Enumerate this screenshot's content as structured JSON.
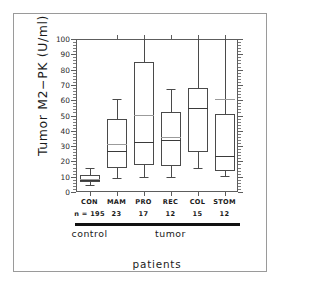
{
  "chart_data": {
    "type": "box",
    "title": "",
    "ylabel": "Tumor M2−PK (U/ml)",
    "xlabel": "patients",
    "ylim": [
      0,
      100
    ],
    "ytick_step": 10,
    "yticks": [
      0,
      10,
      20,
      30,
      40,
      50,
      60,
      70,
      80,
      90,
      100
    ],
    "ytick_labels": [
      "0",
      "10",
      "20",
      "30",
      "40",
      "50",
      "60",
      "70",
      "80",
      "90",
      "100"
    ],
    "grid": false,
    "legend": "none",
    "categories": [
      "CON",
      "MAM",
      "PRO",
      "REC",
      "COL",
      "STOM"
    ],
    "sample_size_prefix": "n = ",
    "sample_sizes": [
      "195",
      "23",
      "17",
      "12",
      "15",
      "12"
    ],
    "boxes": [
      {
        "label": "CON",
        "n": "195",
        "whisker_low": 4.5,
        "q1": 6.5,
        "median": 8.0,
        "mean": 8.8,
        "q3": 11.0,
        "whisker_high": 15.5,
        "clipped_high": false
      },
      {
        "label": "MAM",
        "n": "23",
        "whisker_low": 9.2,
        "q1": 16.0,
        "median": 27.0,
        "mean": 31.3,
        "q3": 48.0,
        "whisker_high": 61.0,
        "clipped_high": false
      },
      {
        "label": "PRO",
        "n": "17",
        "whisker_low": 9.5,
        "q1": 17.5,
        "median": 33.0,
        "mean": 50.5,
        "q3": 85.0,
        "whisker_high": 100.0,
        "clipped_high": true
      },
      {
        "label": "REC",
        "n": "12",
        "whisker_low": 10.0,
        "q1": 17.0,
        "median": 34.0,
        "mean": 36.2,
        "q3": 52.5,
        "whisker_high": 67.0,
        "clipped_high": false
      },
      {
        "label": "COL",
        "n": "15",
        "whisker_low": 15.5,
        "q1": 26.0,
        "median": 55.0,
        "mean": 55.0,
        "q3": 68.0,
        "whisker_high": 100.0,
        "clipped_high": true
      },
      {
        "label": "STOM",
        "n": "12",
        "whisker_low": 10.5,
        "q1": 14.0,
        "median": 23.5,
        "mean": 61.0,
        "q3": 51.0,
        "whisker_high": 100.0,
        "clipped_high": true
      }
    ],
    "groups": [
      {
        "label": "control",
        "members": [
          "CON"
        ]
      },
      {
        "label": "tumor",
        "members": [
          "MAM",
          "PRO",
          "REC",
          "COL",
          "STOM"
        ]
      }
    ]
  },
  "colors": {
    "background": "#ffffff",
    "frame": "#5d5d5d",
    "box_stroke": "#4a4a4a",
    "median_stroke": "#3a3a3a",
    "mean_stroke": "#9b9b9b",
    "group_bar": "#111111",
    "text": "#1a1a1a",
    "outer_border": "#9a9a9a"
  }
}
